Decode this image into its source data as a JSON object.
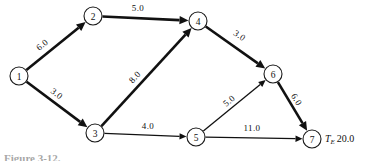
{
  "figure": {
    "caption_partial": "Figure 3-12.",
    "terminal_annotation": {
      "symbol": "T",
      "subscript": "E",
      "value": "20.0"
    }
  },
  "chart_data": {
    "type": "diagram",
    "diagram_type": "directed-network",
    "title": "",
    "nodes": [
      {
        "id": "1",
        "label": "1",
        "x": 19,
        "y": 76,
        "r": 9
      },
      {
        "id": "2",
        "label": "2",
        "x": 93,
        "y": 16,
        "r": 9
      },
      {
        "id": "3",
        "label": "3",
        "x": 95,
        "y": 133,
        "r": 9
      },
      {
        "id": "4",
        "label": "4",
        "x": 198,
        "y": 21,
        "r": 9
      },
      {
        "id": "5",
        "label": "5",
        "x": 196,
        "y": 137,
        "r": 9
      },
      {
        "id": "6",
        "label": "6",
        "x": 273,
        "y": 74,
        "r": 9
      },
      {
        "id": "7",
        "label": "7",
        "x": 312,
        "y": 139,
        "r": 9
      }
    ],
    "edges": [
      {
        "from": "1",
        "to": "2",
        "weight": "6.0",
        "label_x": 44,
        "label_y": 47,
        "label_rot": -39,
        "style": "thick"
      },
      {
        "from": "1",
        "to": "3",
        "weight": "3.0",
        "label_x": 55,
        "label_y": 96,
        "label_rot": 38,
        "style": "thick"
      },
      {
        "from": "2",
        "to": "4",
        "weight": "5.0",
        "label_x": 138,
        "label_y": 11,
        "label_rot": 0,
        "style": "thick"
      },
      {
        "from": "3",
        "to": "4",
        "weight": "8.0",
        "label_x": 137,
        "label_y": 79,
        "label_rot": -48,
        "style": "thick"
      },
      {
        "from": "3",
        "to": "5",
        "weight": "4.0",
        "label_x": 148,
        "label_y": 129,
        "label_rot": 0,
        "style": "thin"
      },
      {
        "from": "4",
        "to": "6",
        "weight": "3.0",
        "label_x": 238,
        "label_y": 38,
        "label_rot": 34,
        "style": "thick"
      },
      {
        "from": "5",
        "to": "6",
        "weight": "5.0",
        "label_x": 231,
        "label_y": 103,
        "label_rot": -41,
        "style": "thin"
      },
      {
        "from": "5",
        "to": "7",
        "weight": "11.0",
        "label_x": 252,
        "label_y": 131,
        "label_rot": 0,
        "style": "thin"
      },
      {
        "from": "6",
        "to": "7",
        "weight": "6.0",
        "label_x": 294,
        "label_y": 101,
        "label_rot": 59,
        "style": "thick"
      }
    ],
    "colors": {
      "stroke": "#111111",
      "node_fill": "#ffffff",
      "background": "#ffffff"
    }
  }
}
